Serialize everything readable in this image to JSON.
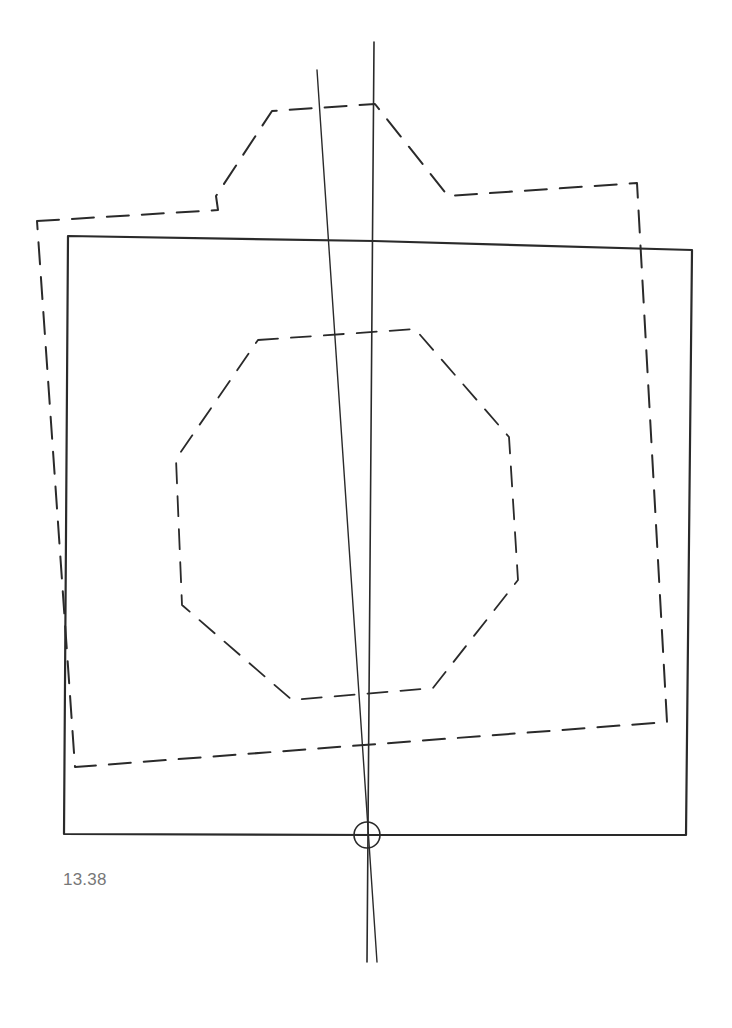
{
  "figure": {
    "caption": "13.38",
    "colors": {
      "ink": "#2a2a2a",
      "caption": "#777777",
      "background": "#ffffff"
    },
    "shapes": {
      "solid_square": {
        "points": "68,236 374,241 692,250 686,835 374,835 64,834",
        "style": "solid"
      },
      "dashed_outline": {
        "points": "37,221 218,210 216,196 272,111 375,104 448,196 637,183 667,722 364,745 75,767",
        "style": "dashed"
      },
      "dashed_octagon": {
        "points": "258,340 415,329 509,437 518,580 433,688 292,700 182,605 176,459",
        "style": "dashed"
      },
      "axis_line_left": {
        "x1": 317,
        "y1": 70,
        "x2": 377,
        "y2": 962
      },
      "axis_line_right": {
        "x1": 374,
        "y1": 42,
        "x2": 367,
        "y2": 962
      },
      "center_marker": {
        "cx": 367,
        "cy": 835,
        "r": 13
      }
    }
  }
}
